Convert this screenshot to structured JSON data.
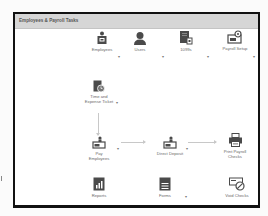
{
  "panel": {
    "title": "Employees & Payroll Tasks"
  },
  "top_row": [
    {
      "label": "Employees",
      "icon": "employee-badge-icon",
      "has_dropdown": true
    },
    {
      "label": "Users",
      "icon": "user-silhouette-icon",
      "has_dropdown": true
    },
    {
      "label": "1099s",
      "icon": "tax-form-icon",
      "has_dropdown": true
    },
    {
      "label": "Payroll Setup",
      "icon": "payroll-setup-icon",
      "has_dropdown": true
    }
  ],
  "workflow": {
    "time_expense": {
      "label_line1": "Time and",
      "label_line2": "Expense Ticket",
      "icon": "timesheet-icon",
      "has_dropdown": true
    },
    "pay_employees": {
      "label_line1": "Pay",
      "label_line2": "Employees",
      "icon": "pay-employees-icon",
      "has_dropdown": true
    },
    "direct_deposit": {
      "label": "Direct Deposit",
      "icon": "direct-deposit-icon",
      "has_dropdown": true
    },
    "print_checks": {
      "label_line1": "Print Payroll",
      "label_line2": "Checks",
      "icon": "printer-icon"
    }
  },
  "bottom_row": [
    {
      "label": "Reports",
      "icon": "report-chart-icon",
      "has_dropdown": false
    },
    {
      "label": "Forms",
      "icon": "forms-icon",
      "has_dropdown": true
    },
    {
      "label": "Void Checks",
      "icon": "void-check-icon",
      "has_dropdown": false
    }
  ],
  "dropdown_glyph": "▾",
  "colors": {
    "icon": "#4a4a4a",
    "header_bg": "#d6d6d6",
    "arrow": "#c8c8c8",
    "label": "#6a6a6a"
  }
}
